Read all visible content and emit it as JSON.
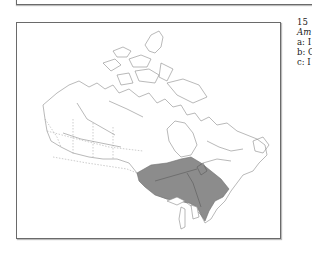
{
  "figure": {
    "number": "15",
    "title_fragment": "Am",
    "legend_entries": [
      {
        "key": "a",
        "text": "a: I"
      },
      {
        "key": "b",
        "text": "b: C"
      },
      {
        "key": "c",
        "text": "c: I"
      }
    ]
  },
  "map": {
    "subject": "Canada",
    "shaded_region": "southern Ontario and southern Quebec",
    "colors": {
      "outline": "#8a8a8a",
      "shaded": "#8c8c8c",
      "frame": "#6a6a6a"
    }
  }
}
